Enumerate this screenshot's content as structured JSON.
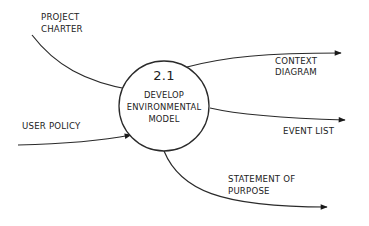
{
  "diagram": {
    "type": "data-flow-diagram",
    "colors": {
      "stroke": "#2a2a2a",
      "text": "#222222",
      "background": "#ffffff"
    },
    "process": {
      "number": "2.1",
      "lines": [
        "DEVELOP",
        "ENVIRONMENTAL",
        "MODEL"
      ]
    },
    "inputs": [
      {
        "id": "project-charter",
        "lines": [
          "PROJECT",
          "CHARTER"
        ]
      },
      {
        "id": "user-policy",
        "lines": [
          "USER POLICY"
        ]
      }
    ],
    "outputs": [
      {
        "id": "context-diagram",
        "lines": [
          "CONTEXT",
          "DIAGRAM"
        ]
      },
      {
        "id": "event-list",
        "lines": [
          "EVENT LIST"
        ]
      },
      {
        "id": "statement-of-purpose",
        "lines": [
          "STATEMENT OF",
          "PURPOSE"
        ]
      }
    ]
  }
}
